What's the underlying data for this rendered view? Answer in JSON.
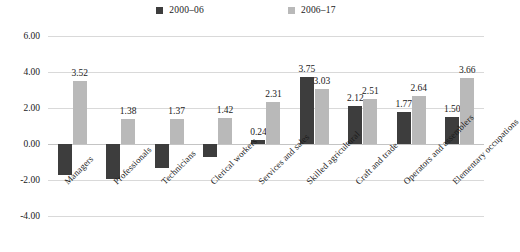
{
  "legend": {
    "items": [
      {
        "label": "2000–06",
        "color": "#3d3d3d",
        "key": "series-2000-06"
      },
      {
        "label": "2006–17",
        "color": "#b9b9b9",
        "key": "series-2006-17"
      }
    ]
  },
  "axis": {
    "ticks": [
      "6.00",
      "4.00",
      "2.00",
      "0.00",
      "-2.00",
      "-4.00"
    ]
  },
  "chart_data": {
    "type": "bar",
    "title": "",
    "subtitle": "",
    "xlabel": "",
    "ylabel": "",
    "ylim": [
      -4.0,
      6.0
    ],
    "ytick_values": [
      6.0,
      4.0,
      2.0,
      0.0,
      -2.0,
      -4.0
    ],
    "grid": true,
    "legend_position": "top-center",
    "categories": [
      "Managers",
      "Professionals",
      "Technicians",
      "Clerical workers",
      "Services and sales",
      "Skilled agricultural",
      "Craft and trade",
      "Operators and assemblers",
      "Elementary occupations"
    ],
    "series": [
      {
        "name": "2000–06",
        "color": "#3d3d3d",
        "values": [
          -1.7,
          -1.92,
          -1.32,
          -0.72,
          0.24,
          3.75,
          2.12,
          1.77,
          1.5
        ],
        "labels": [
          "",
          "",
          "",
          "",
          "0.24",
          "3.75",
          "2.12",
          "1.77",
          "1.50"
        ]
      },
      {
        "name": "2006–17",
        "color": "#b9b9b9",
        "values": [
          3.52,
          1.38,
          1.37,
          1.42,
          2.31,
          3.03,
          2.51,
          2.64,
          3.66
        ],
        "labels": [
          "3.52",
          "1.38",
          "1.37",
          "1.42",
          "2.31",
          "3.03",
          "2.51",
          "2.64",
          "3.66"
        ]
      }
    ]
  }
}
